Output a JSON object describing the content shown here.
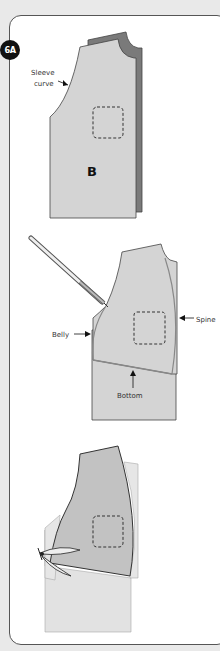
{
  "step": {
    "label": "6A"
  },
  "figure1": {
    "annotation": "Sleeve curve",
    "annotation_line1": "Sleeve",
    "annotation_line2": "curve",
    "piece_label": "B"
  },
  "figure2": {
    "labels": {
      "belly": "Belly",
      "spine": "Spine",
      "bottom": "Bottom"
    }
  },
  "figure3": {},
  "colors": {
    "fabric_light": "#d4d4d4",
    "fabric_dark": "#7a7a7a",
    "fabric_mid": "#c2c2c2",
    "outline": "#444444",
    "background": "#e9e9e9"
  }
}
